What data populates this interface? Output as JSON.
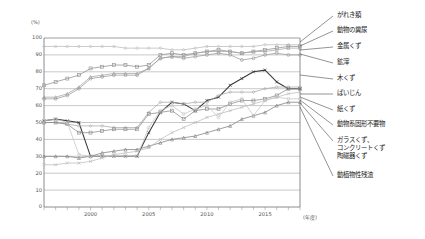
{
  "chart_data": {
    "type": "line",
    "title": "",
    "xlabel": "(年度)",
    "ylabel": "(%)",
    "ylim": [
      0,
      100
    ],
    "ytick_step": 10,
    "xlim": [
      1996,
      2018
    ],
    "grid": true,
    "legend_position": "right-callout",
    "yticks": [
      "100",
      "90",
      "80",
      "70",
      "60",
      "50",
      "40",
      "30",
      "20",
      "10",
      "0"
    ],
    "xticks": [
      "2000",
      "2005",
      "2010",
      "2015"
    ],
    "x": [
      1996,
      1997,
      1998,
      1999,
      2000,
      2001,
      2002,
      2003,
      2004,
      2005,
      2006,
      2007,
      2008,
      2009,
      2010,
      2011,
      2012,
      2013,
      2014,
      2015,
      2016,
      2017,
      2018
    ],
    "series": [
      {
        "name": "がれき類",
        "color": "#b9b9b9",
        "marker": "diamond",
        "values": [
          95,
          95,
          95,
          95,
          95,
          95,
          95,
          94,
          94,
          94,
          94,
          93,
          93,
          94,
          95,
          95,
          95,
          95,
          95,
          96,
          96,
          96,
          96
        ]
      },
      {
        "name": "動物の糞尿",
        "color": "#8f8f8f",
        "marker": "square",
        "values": [
          72,
          74,
          76,
          78,
          82,
          83,
          84,
          84,
          83,
          84,
          90,
          91,
          90,
          91,
          92,
          93,
          92,
          91,
          92,
          93,
          94,
          95,
          95
        ]
      },
      {
        "name": "金属くず",
        "color": "#a5a5a5",
        "marker": "triangle",
        "values": [
          65,
          65,
          67,
          71,
          77,
          78,
          79,
          79,
          79,
          82,
          88,
          89,
          89,
          91,
          92,
          92,
          92,
          91,
          92,
          92,
          93,
          94,
          94
        ]
      },
      {
        "name": "鉱滓",
        "color": "#999999",
        "marker": "circle",
        "values": [
          64,
          64,
          66,
          70,
          76,
          77,
          78,
          78,
          78,
          82,
          88,
          89,
          88,
          89,
          90,
          91,
          90,
          87,
          88,
          90,
          91,
          90,
          90
        ]
      },
      {
        "name": "木くず",
        "color": "#3a3a3a",
        "marker": "cross",
        "values": [
          51,
          52,
          51,
          50,
          30,
          30,
          30,
          30,
          30,
          44,
          56,
          62,
          61,
          57,
          63,
          65,
          72,
          76,
          80,
          81,
          74,
          70,
          70
        ]
      },
      {
        "name": "ばいじん",
        "color": "#aaaaaa",
        "marker": "diamond",
        "values": [
          50,
          50,
          49,
          48,
          48,
          48,
          47,
          47,
          47,
          56,
          62,
          62,
          61,
          62,
          62,
          66,
          68,
          68,
          68,
          70,
          71,
          71,
          71
        ]
      },
      {
        "name": "紙くず",
        "color": "#8a8a8a",
        "marker": "square",
        "values": [
          50,
          50,
          49,
          44,
          44,
          45,
          46,
          46,
          46,
          55,
          56,
          57,
          52,
          57,
          58,
          58,
          61,
          63,
          63,
          64,
          66,
          70,
          70
        ]
      },
      {
        "name": "動物系固形不要物",
        "color": "#7e7e7e",
        "marker": "triangle",
        "values": [
          30,
          30,
          30,
          29,
          30,
          32,
          33,
          34,
          34,
          36,
          38,
          40,
          41,
          42,
          44,
          46,
          48,
          52,
          54,
          56,
          60,
          62,
          62
        ]
      },
      {
        "name": "ガラスくず、\nコンクリートくず\n陶磁器くず",
        "color": "#bcbcbc",
        "marker": "cross",
        "values": [
          25,
          25,
          26,
          26,
          27,
          29,
          31,
          32,
          33,
          35,
          40,
          44,
          47,
          50,
          53,
          55,
          57,
          59,
          61,
          63,
          65,
          67,
          68
        ]
      },
      {
        "name": "動植物性残渣",
        "color": "#c4c4c4",
        "marker": "circle",
        "values": [
          51,
          52,
          50,
          31,
          30,
          30,
          30,
          30,
          30,
          47,
          57,
          60,
          55,
          58,
          60,
          53,
          62,
          64,
          54,
          63,
          65,
          64,
          64
        ]
      }
    ],
    "legend_labels": [
      "がれき類",
      "動物の糞尿",
      "金属くず",
      "鉱滓",
      "木くず",
      "ばいじん",
      "紙くず",
      "動物系固形不要物",
      "ガラスくず、",
      "コンクリートくず",
      "陶磁器くず",
      "動植物性残渣"
    ]
  }
}
